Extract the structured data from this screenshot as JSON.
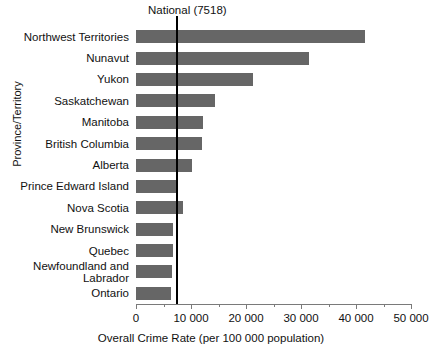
{
  "chart_data": {
    "type": "bar",
    "orientation": "horizontal",
    "title": "",
    "xlabel": "Overall Crime Rate (per 100 000 population)",
    "ylabel": "Province/Territory",
    "xlim": [
      0,
      50000
    ],
    "grid": false,
    "legend": null,
    "categories": [
      "Northwest Territories",
      "Nunavut",
      "Yukon",
      "Saskatchewan",
      "Manitoba",
      "British Columbia",
      "Alberta",
      "Prince Edward Island",
      "Nova Scotia",
      "New Brunswick",
      "Quebec",
      "Newfoundland and\nLabrador",
      "Ontario"
    ],
    "values": [
      41600,
      31450,
      21300,
      14400,
      12200,
      12000,
      10200,
      7400,
      8500,
      6700,
      6700,
      6500,
      6300
    ],
    "tick_values": [
      0,
      10000,
      20000,
      30000,
      40000,
      50000
    ],
    "tick_labels": [
      "0",
      "10 000",
      "20 000",
      "30 000",
      "40 000",
      "50 000"
    ],
    "minor_tick_interval": 5000,
    "annotations": [
      {
        "name": "national-reference-line",
        "label": "National (7518)",
        "value": 7518
      }
    ],
    "colors": {
      "bar": "#666666",
      "reference_line": "#000000",
      "axis": "#7a7a7a",
      "text": "#111111",
      "background": "#ffffff"
    }
  }
}
